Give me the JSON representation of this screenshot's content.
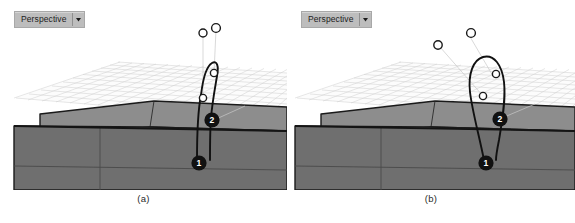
{
  "figure": {
    "background_color": "#ffffff",
    "panels": [
      {
        "id": "panel-a",
        "caption": "(a)",
        "viewport_label": "Perspective",
        "dropdown_icon": "chevron-down-icon",
        "curve_style": "narrow-teardrop-loop",
        "markers": [
          {
            "label": "1",
            "kind": "filled-badge"
          },
          {
            "label": "2",
            "kind": "filled-badge"
          }
        ],
        "control_points": [
          {
            "kind": "hollow-circle",
            "position": "floating-upper-left"
          },
          {
            "kind": "hollow-circle",
            "position": "floating-upper-right"
          },
          {
            "kind": "hollow-circle",
            "position": "on-curve-left"
          },
          {
            "kind": "hollow-circle",
            "position": "on-curve-right"
          }
        ]
      },
      {
        "id": "panel-b",
        "caption": "(b)",
        "viewport_label": "Perspective",
        "dropdown_icon": "chevron-down-icon",
        "curve_style": "wide-open-loop",
        "markers": [
          {
            "label": "1",
            "kind": "filled-badge"
          },
          {
            "label": "2",
            "kind": "filled-badge"
          }
        ],
        "control_points": [
          {
            "kind": "hollow-circle",
            "position": "floating-upper-left"
          },
          {
            "kind": "hollow-circle",
            "position": "floating-upper-right"
          },
          {
            "kind": "hollow-circle",
            "position": "on-curve-left"
          },
          {
            "kind": "hollow-circle",
            "position": "on-curve-right"
          }
        ]
      }
    ],
    "colors": {
      "grid_line": "#c9c9c9",
      "ground_plane": "#fbfbfb",
      "wall_top_face": "#8c8c8c",
      "wall_front_face": "#6e6e6e",
      "outline": "#1a1a1a",
      "badge_fill": "#101010",
      "badge_text": "#ffffff",
      "leader_line": "#c4c4c4",
      "widget_bg": "#bdbdbd",
      "widget_border": "#a8a8a8"
    }
  }
}
